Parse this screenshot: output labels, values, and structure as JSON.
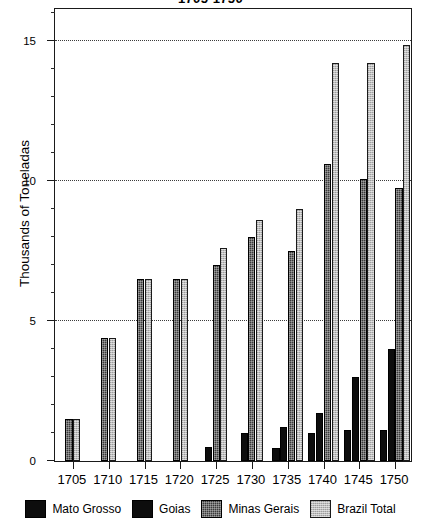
{
  "chart_data": {
    "type": "bar",
    "title": "1705-1750",
    "xlabel": "",
    "ylabel": "Thousands of Toneladas",
    "ylim": [
      0,
      16.2
    ],
    "yticks": [
      0,
      5,
      10,
      15
    ],
    "ytick_labels": [
      "0",
      "5",
      "10",
      "15"
    ],
    "minor_tick_step": 1,
    "grid": "horizontal-dotted at 5, 10, 15",
    "legend_position": "bottom-center",
    "categories": [
      "1705",
      "1710",
      "1715",
      "1720",
      "1725",
      "1730",
      "1735",
      "1740",
      "1745",
      "1750"
    ],
    "series": [
      {
        "name": "Mato Grosso",
        "color": "#0d0d0d",
        "fill": "solid-black",
        "values": [
          0,
          0,
          0,
          0,
          0.5,
          0,
          0.45,
          1.0,
          1.1,
          1.1
        ]
      },
      {
        "name": "Goias",
        "color": "#0d0d0d",
        "fill": "solid-black",
        "values": [
          0,
          0,
          0,
          0,
          0,
          1.0,
          1.2,
          1.7,
          3.0,
          4.0
        ]
      },
      {
        "name": "Minas Gerais",
        "color": "#3a3a3a",
        "fill": "dark-crosshatch",
        "values": [
          1.5,
          4.4,
          6.5,
          6.5,
          7.0,
          8.0,
          7.5,
          10.6,
          10.05,
          9.75
        ]
      },
      {
        "name": "Brazil Total",
        "color": "#bdbdbd",
        "fill": "light-gray-stipple",
        "values": [
          1.5,
          4.4,
          6.5,
          6.5,
          7.6,
          8.6,
          9.0,
          14.2,
          14.2,
          14.85
        ]
      }
    ]
  },
  "legend": {
    "items": [
      {
        "label": "Mato Grosso",
        "swatch": "legend-swatch-mato-grosso"
      },
      {
        "label": "Goias",
        "swatch": "legend-swatch-goias"
      },
      {
        "label": "Minas Gerais",
        "swatch": "legend-swatch-minas-gerais"
      },
      {
        "label": "Brazil Total",
        "swatch": "legend-swatch-brazil-total"
      }
    ]
  }
}
